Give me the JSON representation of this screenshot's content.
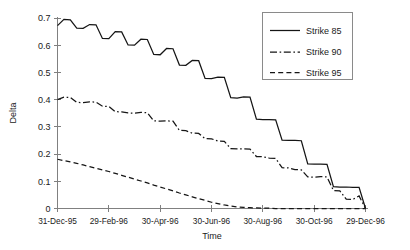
{
  "chart_data": {
    "type": "line",
    "title": "",
    "xlabel": "Time",
    "ylabel": "Delta",
    "ylim": [
      0,
      0.7
    ],
    "grid": false,
    "legend_position": "top-right",
    "yticks": [
      "0",
      "0.1",
      "0.2",
      "0.3",
      "0.4",
      "0.5",
      "0.6",
      "0.7"
    ],
    "ytick_values": [
      0,
      0.1,
      0.2,
      0.3,
      0.4,
      0.5,
      0.6,
      0.7
    ],
    "xticks": [
      "31-Dec-95",
      "29-Feb-96",
      "30-Apr-96",
      "30-Jun-96",
      "30-Aug-96",
      "30-Oct-96",
      "29-Dec-96"
    ],
    "xtick_values": [
      0,
      2,
      4,
      6,
      8,
      10,
      12
    ],
    "xlim": [
      0,
      12
    ],
    "x": [
      0,
      0.25,
      0.5,
      0.75,
      1,
      1.25,
      1.5,
      1.75,
      2,
      2.25,
      2.5,
      2.75,
      3,
      3.25,
      3.5,
      3.75,
      4,
      4.25,
      4.5,
      4.75,
      5,
      5.25,
      5.5,
      5.75,
      6,
      6.25,
      6.5,
      6.75,
      7,
      7.25,
      7.5,
      7.75,
      8,
      8.25,
      8.5,
      8.75,
      9,
      9.25,
      9.5,
      9.75,
      10,
      10.25,
      10.5,
      10.75,
      11,
      11.25,
      11.5,
      11.75,
      12
    ],
    "series": [
      {
        "name": "Strike 85",
        "style": "solid",
        "color": "#151515",
        "values": [
          0.672,
          0.695,
          0.693,
          0.663,
          0.662,
          0.676,
          0.675,
          0.625,
          0.624,
          0.65,
          0.649,
          0.601,
          0.6,
          0.622,
          0.621,
          0.566,
          0.565,
          0.588,
          0.587,
          0.527,
          0.526,
          0.544,
          0.543,
          0.478,
          0.477,
          0.483,
          0.482,
          0.407,
          0.406,
          0.41,
          0.409,
          0.328,
          0.327,
          0.327,
          0.326,
          0.251,
          0.25,
          0.25,
          0.249,
          0.164,
          0.163,
          0.163,
          0.162,
          0.08,
          0.079,
          0.079,
          0.078,
          0.078,
          0.0
        ]
      },
      {
        "name": "Strike 90",
        "style": "dashdot",
        "color": "#151515",
        "values": [
          0.4,
          0.409,
          0.408,
          0.39,
          0.389,
          0.392,
          0.391,
          0.376,
          0.375,
          0.356,
          0.355,
          0.351,
          0.35,
          0.353,
          0.352,
          0.322,
          0.321,
          0.322,
          0.321,
          0.287,
          0.286,
          0.277,
          0.276,
          0.257,
          0.256,
          0.248,
          0.247,
          0.22,
          0.219,
          0.219,
          0.218,
          0.191,
          0.19,
          0.185,
          0.184,
          0.15,
          0.149,
          0.143,
          0.142,
          0.116,
          0.115,
          0.117,
          0.116,
          0.066,
          0.065,
          0.034,
          0.033,
          0.046,
          0.0
        ]
      },
      {
        "name": "Strike 95",
        "style": "dashed",
        "color": "#151515",
        "values": [
          0.181,
          0.176,
          0.171,
          0.166,
          0.16,
          0.154,
          0.148,
          0.142,
          0.136,
          0.129,
          0.122,
          0.115,
          0.108,
          0.101,
          0.094,
          0.086,
          0.079,
          0.072,
          0.065,
          0.057,
          0.05,
          0.043,
          0.036,
          0.03,
          0.023,
          0.018,
          0.013,
          0.009,
          0.006,
          0.004,
          0.003,
          0.002,
          0.001,
          0.001,
          0.0,
          0.0,
          0.0,
          0.0,
          0.0,
          0.0,
          0.0,
          0.0,
          0.0,
          0.0,
          0.0,
          0.0,
          0.0,
          0.0,
          0.0
        ]
      }
    ]
  },
  "legend": {
    "entries": [
      {
        "label": "Strike 85"
      },
      {
        "label": "Strike 90"
      },
      {
        "label": "Strike 95"
      }
    ]
  },
  "axes": {
    "y_title": "Delta",
    "x_title": "Time"
  }
}
